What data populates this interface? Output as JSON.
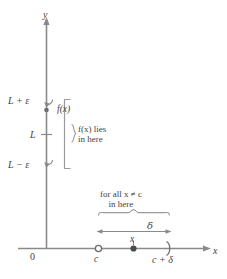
{
  "figure": {
    "axes": {
      "y_label": "y",
      "x_label": "x",
      "origin_label": "0"
    },
    "y_ticks": [
      {
        "id": "upper",
        "label": "L + ε"
      },
      {
        "id": "center",
        "label": "L"
      },
      {
        "id": "lower",
        "label": "L − ε"
      }
    ],
    "points": {
      "fx_label": "f(x)",
      "c_label": "c",
      "x_label": "x",
      "c_plus_delta_label": "c + δ"
    },
    "annotations": {
      "fx_brace_line1": "f(x) lies",
      "fx_brace_line2": "in here",
      "x_brace_line1": "for all x ≠ c",
      "x_brace_line2": "in here",
      "delta_label": "δ"
    },
    "colors": {
      "axis": "#8a8a8a",
      "text": "#3f3f3f",
      "bracket": "#9a9a9a",
      "marker": "#555555"
    }
  }
}
